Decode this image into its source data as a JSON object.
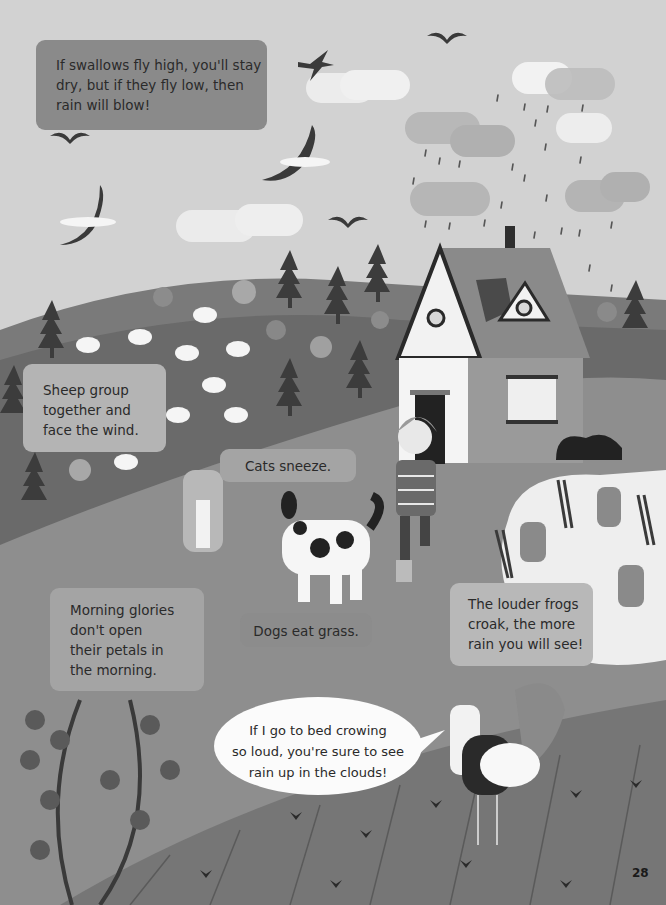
{
  "page": {
    "type": "illustrated book page",
    "theme": "Weather folklore – signs of rain",
    "page_number": "28"
  },
  "text_boxes": {
    "swallows": {
      "lines": [
        "If swallows fly high, you'll stay",
        "dry, but if they fly low, then",
        "rain will blow!"
      ]
    },
    "sheep": {
      "lines": [
        "Sheep group",
        "together and",
        "face the wind."
      ]
    },
    "cats": {
      "lines": [
        "Cats sneeze."
      ]
    },
    "morning_glories": {
      "lines": [
        "Morning glories",
        "don't open",
        "their petals in",
        "the morning."
      ]
    },
    "dogs": {
      "lines": [
        "Dogs eat grass."
      ]
    },
    "frogs": {
      "lines": [
        "The louder frogs",
        "croak, the more",
        "rain you will see!"
      ]
    },
    "rooster_speech": {
      "lines": [
        "If I go to bed crowing",
        "so loud, you're sure to see",
        "rain up in the clouds!"
      ]
    }
  },
  "illustrations": {
    "sky": [
      "swallow-bird",
      "seagull-birds",
      "flying-birds",
      "white-clouds",
      "rain-clouds",
      "rain-drops"
    ],
    "hills": [
      "sheep-flock",
      "pine-trees",
      "round-trees"
    ],
    "house": [
      "cottage",
      "chimney",
      "roof-window",
      "door",
      "window"
    ],
    "characters": [
      "girl",
      "spotted-dog",
      "striped-cat",
      "rooster",
      "frogs"
    ],
    "foreground": [
      "pond",
      "reeds",
      "morning-glory-vine",
      "field-rows",
      "flowers",
      "bush"
    ]
  },
  "colors": {
    "sky": "#d2d2d2",
    "far_hill": "#7a7a7a",
    "mid_hill": "#6a6a6a",
    "meadow": "#8e8e8e",
    "field": "#767676",
    "pond": "#f0f0f0",
    "text": "#2a2a2a"
  }
}
